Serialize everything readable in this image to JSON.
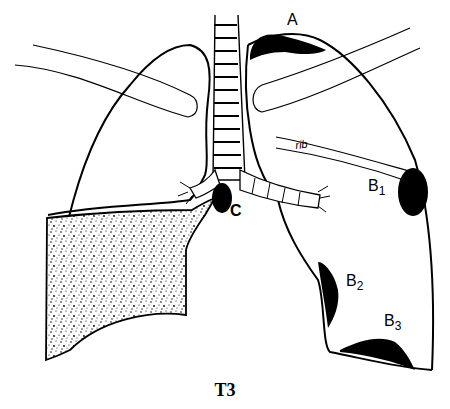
{
  "diagram": {
    "caption": "T3",
    "labels": {
      "A": "A",
      "B1_base": "B",
      "B1_sub": "1",
      "B2_base": "B",
      "B2_sub": "2",
      "B3_base": "B",
      "B3_sub": "3",
      "C": "C",
      "rib": "rib"
    },
    "structures": [
      "trachea",
      "left-lung",
      "right-lung",
      "upper-ribs",
      "pleural-effusion",
      "tumor-A",
      "tumor-B1",
      "tumor-B2",
      "tumor-B3",
      "tumor-C"
    ],
    "colors": {
      "ink": "#000000",
      "background": "#ffffff"
    }
  }
}
